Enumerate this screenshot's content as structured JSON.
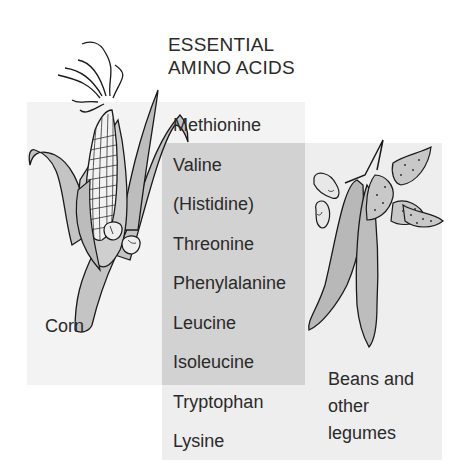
{
  "title": {
    "line1": "ESSENTIAL",
    "line2": "AMINO ACIDS"
  },
  "amino_acids": [
    {
      "name": "Methionine",
      "source": "corn"
    },
    {
      "name": "Valine",
      "source": "both"
    },
    {
      "name": "(Histidine)",
      "source": "both"
    },
    {
      "name": "Threonine",
      "source": "both"
    },
    {
      "name": "Phenylalanine",
      "source": "both"
    },
    {
      "name": "Leucine",
      "source": "both"
    },
    {
      "name": "Isoleucine",
      "source": "both"
    },
    {
      "name": "Tryptophan",
      "source": "beans"
    },
    {
      "name": "Lysine",
      "source": "beans"
    }
  ],
  "labels": {
    "corn": "Corn",
    "beans": [
      "Beans and",
      "other",
      "legumes"
    ]
  },
  "colors": {
    "corn_panel": "#f3f3f3",
    "beans_panel": "#eeeeee",
    "overlap_panel": "#d2d2d2",
    "plant_fill": "#c4c4c4",
    "outline": "#1a1a1a"
  },
  "illustrations": [
    "corn-ear-illustration",
    "corn-kernels-illustration",
    "bean-pods-illustration",
    "bean-seeds-illustration"
  ]
}
